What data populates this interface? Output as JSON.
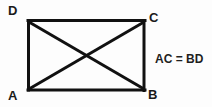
{
  "figure": {
    "type": "geometry-diagram",
    "shape": "rectangle",
    "title": "",
    "stroke_color": "#111111",
    "background_color": "#fdfdfd",
    "stroke_width": 3,
    "vertices": [
      {
        "name": "A",
        "label": "A",
        "position": "bottom-left",
        "x": 28,
        "y": 90
      },
      {
        "name": "B",
        "label": "B",
        "position": "bottom-right",
        "x": 145,
        "y": 90
      },
      {
        "name": "C",
        "label": "C",
        "position": "top-right",
        "x": 145,
        "y": 21
      },
      {
        "name": "D",
        "label": "D",
        "position": "top-left",
        "x": 28,
        "y": 21
      }
    ],
    "sides": [
      {
        "name": "side-DC",
        "from": "D",
        "to": "C"
      },
      {
        "name": "side-CB",
        "from": "C",
        "to": "B"
      },
      {
        "name": "side-BA",
        "from": "B",
        "to": "A"
      },
      {
        "name": "side-AD",
        "from": "A",
        "to": "D"
      }
    ],
    "diagonals": [
      {
        "name": "diagonal-AC",
        "from": "A",
        "to": "C"
      },
      {
        "name": "diagonal-BD",
        "from": "B",
        "to": "D"
      }
    ],
    "intersection": {
      "x": 86,
      "y": 56
    },
    "annotation": {
      "text": "AC = BD",
      "x": 155,
      "y": 52
    }
  }
}
